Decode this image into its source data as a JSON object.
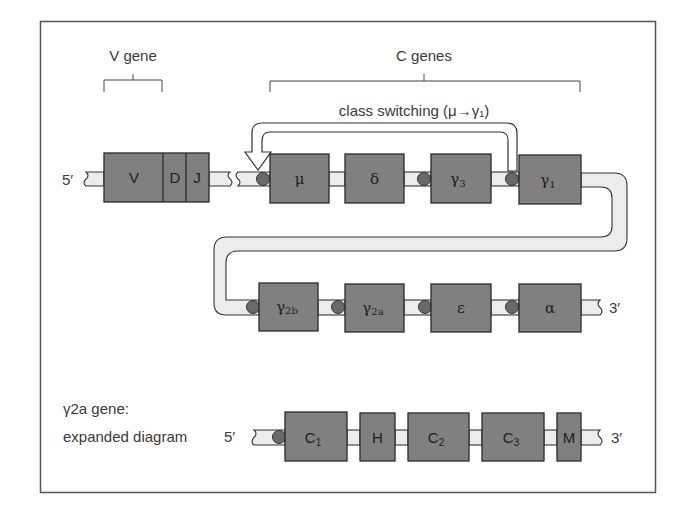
{
  "figure": {
    "v_gene_label": "V gene",
    "c_genes_label": "C genes",
    "class_switching_label": "class switching (μ→γ₁)",
    "row1": {
      "five_prime": "5′",
      "vdj_segments": [
        "V",
        "D",
        "J"
      ],
      "c_genes": [
        {
          "name": "μ",
          "sub": ""
        },
        {
          "name": "δ",
          "sub": ""
        },
        {
          "name": "γ",
          "sub": "3"
        },
        {
          "name": "γ",
          "sub": "1"
        }
      ]
    },
    "row2": {
      "c_genes": [
        {
          "name": "γ",
          "sub": "2b"
        },
        {
          "name": "γ",
          "sub": "2a"
        },
        {
          "name": "ε",
          "sub": ""
        },
        {
          "name": "α",
          "sub": ""
        }
      ],
      "three_prime": "3′"
    },
    "row3": {
      "caption_line1": "γ2a gene:",
      "caption_line2": "expanded diagram",
      "five_prime": "5′",
      "exons": [
        {
          "name": "C",
          "sub": "1"
        },
        {
          "name": "H",
          "sub": ""
        },
        {
          "name": "C",
          "sub": "2"
        },
        {
          "name": "C",
          "sub": "3"
        },
        {
          "name": "M",
          "sub": ""
        }
      ],
      "three_prime": "3′"
    },
    "colors": {
      "gene_box": "#808080",
      "switch_region": "#6a6a6a",
      "strand": "#ececec"
    }
  }
}
